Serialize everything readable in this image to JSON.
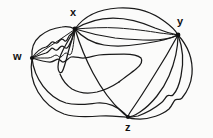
{
  "figure": {
    "kind": "hand-drawn-graph-diagram",
    "title": "",
    "background_color": "#fbfbfa",
    "ink_color": "#1a1a1a",
    "width": 213,
    "height": 138
  },
  "graph_data": {
    "type": "multigraph",
    "vertex_count": 4,
    "edge_count": 16,
    "vertices": [
      {
        "id": "w",
        "label": "w",
        "x": 32,
        "y": 58,
        "label_x": 13,
        "label_y": 51
      },
      {
        "id": "x",
        "label": "x",
        "x": 75,
        "y": 29,
        "label_x": 70,
        "label_y": 7
      },
      {
        "id": "y",
        "label": "y",
        "x": 178,
        "y": 35,
        "label_x": 177,
        "label_y": 16
      },
      {
        "id": "z",
        "label": "z",
        "x": 128,
        "y": 117,
        "label_x": 125,
        "label_y": 122
      }
    ],
    "edges": [
      {
        "from": "w",
        "to": "x",
        "multiplicity_index": 1
      },
      {
        "from": "w",
        "to": "x",
        "multiplicity_index": 2
      },
      {
        "from": "w",
        "to": "x",
        "multiplicity_index": 3
      },
      {
        "from": "w",
        "to": "x",
        "multiplicity_index": 4
      },
      {
        "from": "x",
        "to": "y",
        "multiplicity_index": 1
      },
      {
        "from": "x",
        "to": "y",
        "multiplicity_index": 2
      },
      {
        "from": "x",
        "to": "y",
        "multiplicity_index": 3
      },
      {
        "from": "x",
        "to": "y",
        "multiplicity_index": 4
      },
      {
        "from": "x",
        "to": "z",
        "multiplicity_index": 1
      },
      {
        "from": "y",
        "to": "z",
        "multiplicity_index": 1
      },
      {
        "from": "y",
        "to": "z",
        "multiplicity_index": 2
      },
      {
        "from": "y",
        "to": "z",
        "multiplicity_index": 3
      },
      {
        "from": "y",
        "to": "z",
        "multiplicity_index": 4
      },
      {
        "from": "w",
        "to": "z",
        "multiplicity_index": 1
      },
      {
        "from": "w",
        "to": "z",
        "multiplicity_index": 2
      },
      {
        "from": "w",
        "to": "y",
        "multiplicity_index": 1
      }
    ]
  },
  "labels": {
    "w": "w",
    "x": "x",
    "y": "y",
    "z": "z"
  }
}
